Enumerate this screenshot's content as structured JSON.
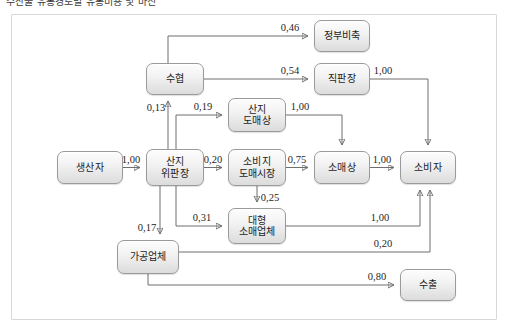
{
  "caption": "수산물 유통경로별 유통비용 및 마진",
  "diagram": {
    "nodes": [
      {
        "id": "producer",
        "label": "생산자",
        "lines": [
          "생산자"
        ],
        "x": 57,
        "y": 151,
        "w": 66,
        "h": 33
      },
      {
        "id": "auction",
        "label": "산지 위판장",
        "lines": [
          "산지",
          "위판장"
        ],
        "x": 146,
        "y": 149,
        "w": 58,
        "h": 37
      },
      {
        "id": "coop",
        "label": "수협",
        "lines": [
          "수협"
        ],
        "x": 146,
        "y": 63,
        "w": 58,
        "h": 32
      },
      {
        "id": "stockpile",
        "label": "정부비축",
        "lines": [
          "정부비축"
        ],
        "x": 314,
        "y": 20,
        "w": 56,
        "h": 32
      },
      {
        "id": "directshop",
        "label": "직판장",
        "lines": [
          "직판장"
        ],
        "x": 314,
        "y": 63,
        "w": 56,
        "h": 32
      },
      {
        "id": "localwhole",
        "label": "산지 도매상",
        "lines": [
          "산지",
          "도매상"
        ],
        "x": 228,
        "y": 98,
        "w": 58,
        "h": 34
      },
      {
        "id": "citywhole",
        "label": "소비지 도매시장",
        "lines": [
          "소비지",
          "도매시장"
        ],
        "x": 228,
        "y": 149,
        "w": 58,
        "h": 37
      },
      {
        "id": "retailer",
        "label": "소매상",
        "lines": [
          "소매상"
        ],
        "x": 314,
        "y": 151,
        "w": 56,
        "h": 33
      },
      {
        "id": "consumer",
        "label": "소비자",
        "lines": [
          "소비자"
        ],
        "x": 400,
        "y": 151,
        "w": 56,
        "h": 33
      },
      {
        "id": "bigretail",
        "label": "대형 소매업체",
        "lines": [
          "대형",
          "소매업체"
        ],
        "x": 228,
        "y": 208,
        "w": 58,
        "h": 36
      },
      {
        "id": "processor",
        "label": "가공업체",
        "lines": [
          "가공업체"
        ],
        "x": 117,
        "y": 240,
        "w": 62,
        "h": 34
      },
      {
        "id": "export",
        "label": "수출",
        "lines": [
          "수출"
        ],
        "x": 400,
        "y": 269,
        "w": 56,
        "h": 32
      }
    ],
    "edges": [
      {
        "id": "e-producer-auction",
        "from": "생산자",
        "to": "산지 위판장",
        "value": "1,00"
      },
      {
        "id": "e-auction-coop",
        "from": "산지 위판장",
        "to": "수협",
        "value": "0,13"
      },
      {
        "id": "e-auction-localwhole",
        "from": "산지 위판장",
        "to": "산지 도매상",
        "value": "0,19"
      },
      {
        "id": "e-auction-citywhole",
        "from": "산지 위판장",
        "to": "소비지 도매시장",
        "value": "0,20"
      },
      {
        "id": "e-auction-bigretail",
        "from": "산지 위판장",
        "to": "대형 소매업체",
        "value": "0,31"
      },
      {
        "id": "e-auction-processor",
        "from": "산지 위판장",
        "to": "가공업체",
        "value": "0,17"
      },
      {
        "id": "e-coop-stockpile",
        "from": "수협",
        "to": "정부비축",
        "value": "0,46"
      },
      {
        "id": "e-coop-directshop",
        "from": "수협",
        "to": "직판장",
        "value": "0,54"
      },
      {
        "id": "e-directshop-consumer",
        "from": "직판장",
        "to": "소비자",
        "value": "1,00"
      },
      {
        "id": "e-localwhole-retailer",
        "from": "산지 도매상",
        "to": "소매상",
        "value": "1,00"
      },
      {
        "id": "e-citywhole-retailer",
        "from": "소비지 도매시장",
        "to": "소매상",
        "value": "0,75"
      },
      {
        "id": "e-citywhole-bigretail",
        "from": "소비지 도매시장",
        "to": "대형 소매업체",
        "value": "0,25"
      },
      {
        "id": "e-retailer-consumer",
        "from": "소매상",
        "to": "소비자",
        "value": "1,00"
      },
      {
        "id": "e-bigretail-consumer",
        "from": "대형 소매업체",
        "to": "소비자",
        "value": "1,00"
      },
      {
        "id": "e-processor-consumer",
        "from": "가공업체",
        "to": "소비자",
        "value": "0,20"
      },
      {
        "id": "e-processor-export",
        "from": "가공업체",
        "to": "수출",
        "value": "0,80"
      }
    ]
  },
  "colors": {
    "node_border": "#9a9a9a",
    "node_fill_top": "#fdfdfd",
    "node_fill_bottom": "#dcdcdc",
    "wire": "#6f6f6f",
    "frame": "#d8d8d8",
    "text": "#1d1d1d"
  }
}
